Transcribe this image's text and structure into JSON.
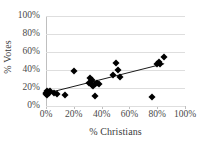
{
  "chart_data": {
    "type": "scatter",
    "title": "",
    "xlabel": "% Christians",
    "ylabel": "% Votes",
    "xlim": [
      0,
      100
    ],
    "ylim": [
      0,
      100
    ],
    "xticks": [
      "0%",
      "20%",
      "40%",
      "60%",
      "80%",
      "100%"
    ],
    "xtick_values": [
      0,
      20,
      40,
      60,
      80,
      100
    ],
    "yticks": [
      "0%",
      "20%",
      "40%",
      "60%",
      "80%",
      "100%"
    ],
    "ytick_values": [
      0,
      20,
      40,
      60,
      80,
      100
    ],
    "grid": "horizontal",
    "legend": "none",
    "marker": "diamond",
    "marker_color": "#000000",
    "points": [
      {
        "x": 0,
        "y": 13
      },
      {
        "x": 0,
        "y": 15
      },
      {
        "x": 1,
        "y": 17
      },
      {
        "x": 1,
        "y": 12
      },
      {
        "x": 2,
        "y": 16
      },
      {
        "x": 2,
        "y": 14
      },
      {
        "x": 3,
        "y": 17
      },
      {
        "x": 6,
        "y": 14
      },
      {
        "x": 8,
        "y": 13
      },
      {
        "x": 14,
        "y": 12
      },
      {
        "x": 20,
        "y": 39
      },
      {
        "x": 31,
        "y": 26
      },
      {
        "x": 32,
        "y": 31
      },
      {
        "x": 33,
        "y": 29
      },
      {
        "x": 33,
        "y": 23
      },
      {
        "x": 34,
        "y": 22
      },
      {
        "x": 35,
        "y": 24
      },
      {
        "x": 35,
        "y": 11
      },
      {
        "x": 37,
        "y": 26
      },
      {
        "x": 38,
        "y": 25
      },
      {
        "x": 48,
        "y": 35
      },
      {
        "x": 50,
        "y": 48
      },
      {
        "x": 52,
        "y": 40
      },
      {
        "x": 53,
        "y": 32
      },
      {
        "x": 76,
        "y": 10
      },
      {
        "x": 80,
        "y": 47
      },
      {
        "x": 81,
        "y": 49
      },
      {
        "x": 82,
        "y": 47
      },
      {
        "x": 85,
        "y": 55
      }
    ],
    "trendline": {
      "type": "linear",
      "x_start": 0,
      "y_start": 14,
      "x_end": 85,
      "y_end": 47,
      "color": "#000000"
    }
  }
}
